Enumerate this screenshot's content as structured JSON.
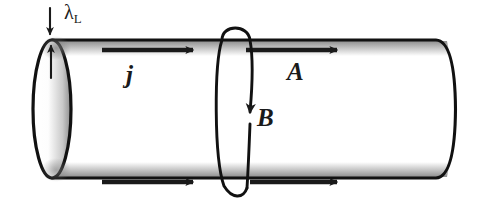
{
  "figure": {
    "background_color": "#ffffff",
    "width": 484,
    "height": 223
  },
  "labels": {
    "penetration_depth": {
      "symbol": "λ",
      "subscript": "L",
      "name": "London penetration depth"
    },
    "current_density": {
      "text": "j",
      "name": "current density"
    },
    "vector_potential": {
      "text": "A",
      "name": "vector potential"
    },
    "magnetic_field": {
      "text": "B",
      "name": "magnetic field"
    }
  },
  "colors": {
    "outline": "#111111",
    "surface_band": "#b9b9b9",
    "arrow": "#1a1a1a",
    "cap_shade": "#9a9a9a",
    "paper": "#ffffff"
  },
  "geometry": {
    "cylinder": {
      "left_cap_center_x": 52,
      "left_cap_center_y": 109,
      "cap_rx": 19,
      "cap_ry": 69,
      "right_end_x": 455,
      "top_y": 40,
      "bottom_y": 178
    },
    "field_loop": {
      "center_x": 238,
      "center_y": 109,
      "rx": 16,
      "ry": 76
    },
    "current_arrows": [
      {
        "name": "top-left-arrow",
        "x1": 102,
        "y1": 50,
        "x2": 196,
        "y2": 50
      },
      {
        "name": "top-right-arrow",
        "x1": 246,
        "y1": 50,
        "x2": 340,
        "y2": 50
      },
      {
        "name": "bottom-left-arrow",
        "x1": 102,
        "y1": 182,
        "x2": 196,
        "y2": 182
      },
      {
        "name": "bottom-right-arrow",
        "x1": 250,
        "y1": 182,
        "x2": 340,
        "y2": 182
      }
    ]
  }
}
